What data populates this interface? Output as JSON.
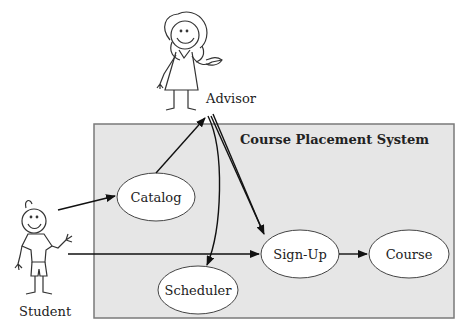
{
  "system": {
    "title": "Course Placement System",
    "fill": "#e6e6e6",
    "border": "#7a7a7a"
  },
  "actors": {
    "advisor": {
      "label": "Advisor"
    },
    "student": {
      "label": "Student"
    }
  },
  "use_cases": {
    "catalog": {
      "label": "Catalog"
    },
    "scheduler": {
      "label": "Scheduler"
    },
    "signup": {
      "label": "Sign-Up"
    },
    "course": {
      "label": "Course"
    }
  },
  "relationships": [
    {
      "from": "Student",
      "to": "Catalog"
    },
    {
      "from": "Student",
      "to": "Sign-Up"
    },
    {
      "from": "Catalog",
      "to": "Advisor"
    },
    {
      "from": "Advisor",
      "to": "Scheduler"
    },
    {
      "from": "Advisor",
      "to": "Sign-Up"
    },
    {
      "from": "Sign-Up",
      "to": "Course"
    }
  ]
}
